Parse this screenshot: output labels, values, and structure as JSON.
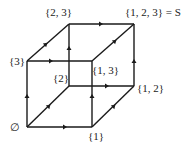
{
  "diagram": {
    "type": "hasse-cube",
    "vertices": [
      {
        "id": "empty",
        "label": "∅",
        "x": 27,
        "y": 127
      },
      {
        "id": "1",
        "label": "{1}",
        "x": 92,
        "y": 127
      },
      {
        "id": "2",
        "label": "{2}",
        "x": 69,
        "y": 86
      },
      {
        "id": "3",
        "label": "{3}",
        "x": 27,
        "y": 61
      },
      {
        "id": "12",
        "label": "{1, 2}",
        "x": 134,
        "y": 86
      },
      {
        "id": "13",
        "label": "{1, 3}",
        "x": 92,
        "y": 61
      },
      {
        "id": "23",
        "label": "{2, 3}",
        "x": 69,
        "y": 24
      },
      {
        "id": "123",
        "label": "{1, 2, 3} = S",
        "x": 134,
        "y": 24
      }
    ],
    "edges": [
      {
        "from": "empty",
        "to": "1"
      },
      {
        "from": "empty",
        "to": "2"
      },
      {
        "from": "empty",
        "to": "3"
      },
      {
        "from": "1",
        "to": "12"
      },
      {
        "from": "1",
        "to": "13"
      },
      {
        "from": "2",
        "to": "12"
      },
      {
        "from": "2",
        "to": "23"
      },
      {
        "from": "3",
        "to": "13"
      },
      {
        "from": "3",
        "to": "23"
      },
      {
        "from": "12",
        "to": "123"
      },
      {
        "from": "13",
        "to": "123"
      },
      {
        "from": "23",
        "to": "123"
      }
    ],
    "labels": {
      "empty": "∅",
      "s1": "{1}",
      "s2": "{2}",
      "s3": "{3}",
      "s12": "{1, 2}",
      "s13": "{1, 3}",
      "s23": "{2, 3}",
      "s123": "{1, 2, 3} = S"
    }
  }
}
